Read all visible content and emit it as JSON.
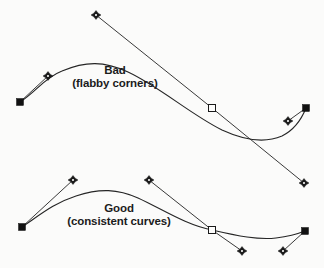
{
  "figure": {
    "width": 324,
    "height": 268,
    "background_color": "#fbfbfa",
    "ink_color": "#1a1a1a",
    "type": "bezier-curve-comparison-diagram"
  },
  "examples": [
    {
      "id": "bad",
      "title": "Bad",
      "subtitle": "(flabby corners)",
      "curve_path": "M 20 102 C 36 92 44 78 62 71 C 86 61 104 61 128 72 C 160 87 190 114 222 130 C 248 142 268 142 282 136 C 296 129 302 118 306 108",
      "handle_lines": [
        {
          "from": [
            20,
            102
          ],
          "to": [
            48,
            76
          ]
        },
        {
          "from": [
            96,
            15
          ],
          "to": [
            212,
            108
          ]
        },
        {
          "from": [
            212,
            108
          ],
          "to": [
            304,
            183
          ]
        },
        {
          "from": [
            306,
            108
          ],
          "to": [
            288,
            121
          ]
        }
      ],
      "anchors": [
        {
          "kind": "filled-square",
          "x": 20,
          "y": 102
        },
        {
          "kind": "hollow-square",
          "x": 212,
          "y": 108
        },
        {
          "kind": "filled-square",
          "x": 306,
          "y": 108
        }
      ],
      "handles": [
        {
          "kind": "diamond",
          "x": 48,
          "y": 76
        },
        {
          "kind": "diamond",
          "x": 96,
          "y": 15
        },
        {
          "kind": "diamond",
          "x": 304,
          "y": 183
        },
        {
          "kind": "diamond",
          "x": 288,
          "y": 121
        }
      ]
    },
    {
      "id": "good",
      "title": "Good",
      "subtitle": "(consistent curves)",
      "curve_path": "M 22 227 C 40 215 54 203 76 196 C 100 188 118 189 138 198 C 162 209 186 225 212 230 C 238 236 258 240 276 238 C 292 236 300 233 305 231",
      "handle_lines": [
        {
          "from": [
            22,
            227
          ],
          "to": [
            73,
            180
          ]
        },
        {
          "from": [
            149,
            180
          ],
          "to": [
            212,
            230
          ]
        },
        {
          "from": [
            212,
            230
          ],
          "to": [
            242,
            251
          ]
        },
        {
          "from": [
            305,
            231
          ],
          "to": [
            283,
            251
          ]
        }
      ],
      "anchors": [
        {
          "kind": "filled-square",
          "x": 22,
          "y": 227
        },
        {
          "kind": "hollow-square",
          "x": 212,
          "y": 230
        },
        {
          "kind": "filled-square",
          "x": 305,
          "y": 231
        }
      ],
      "handles": [
        {
          "kind": "diamond",
          "x": 73,
          "y": 180
        },
        {
          "kind": "diamond",
          "x": 149,
          "y": 180
        },
        {
          "kind": "diamond",
          "x": 242,
          "y": 251
        },
        {
          "kind": "diamond",
          "x": 283,
          "y": 251
        }
      ]
    }
  ]
}
